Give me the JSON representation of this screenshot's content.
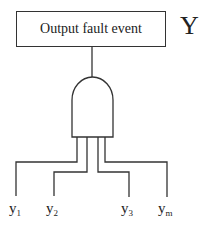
{
  "top_event": {
    "label": "Output fault event",
    "symbol": "Y"
  },
  "gate": {
    "type": "AND",
    "icon": "and-gate-icon"
  },
  "inputs": [
    {
      "base": "y",
      "sub": "1"
    },
    {
      "base": "y",
      "sub": "2"
    },
    {
      "base": "y",
      "sub": "3"
    },
    {
      "base": "y",
      "sub": "m"
    }
  ],
  "colors": {
    "line": "#333333",
    "text": "#222222",
    "background": "#ffffff"
  }
}
